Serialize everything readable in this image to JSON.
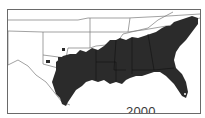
{
  "map": {
    "title": "Distribution range, southeastern United States",
    "year_label": "2000",
    "colors": {
      "shaded_region": "#2b2b2b",
      "state_borders": "#7a7a7a",
      "background": "#ffffff",
      "frame": "#6a6a6a"
    },
    "regions_shaded": [
      "Texas (east)",
      "Louisiana",
      "Arkansas (south)",
      "Mississippi",
      "Alabama",
      "Georgia",
      "Florida",
      "South Carolina",
      "North Carolina (east)",
      "Oklahoma (southeast)",
      "Tennessee (south)"
    ]
  }
}
